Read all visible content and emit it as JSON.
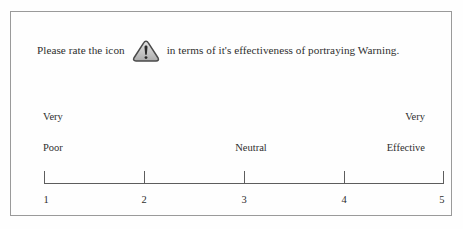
{
  "survey": {
    "prompt": {
      "lead_text": "Please rate the icon",
      "tail_text": "in terms of it's effectiveness of portraying Warning.",
      "icon_name": "warning-triangle-icon",
      "icon_target": "Warning"
    },
    "anchors": {
      "left_top": "Very",
      "left_bottom": "Poor",
      "middle": "Neutral",
      "right_top": "Very",
      "right_bottom": "Effective"
    },
    "scale": {
      "points": [
        "1",
        "2",
        "3",
        "4",
        "5"
      ],
      "min_value": 1,
      "max_value": 5,
      "selected": null
    },
    "colors": {
      "frame_border": "#9a9a9a",
      "axis_line": "#5d5d5d",
      "text": "#2e2e2e",
      "background": "#fefefe",
      "icon_fill": "#c9c9c9",
      "icon_stroke": "#4a4a4a"
    }
  }
}
